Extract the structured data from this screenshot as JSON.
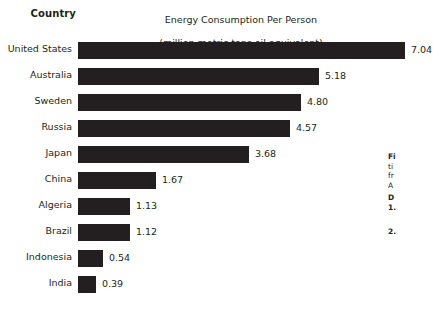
{
  "chart_data": {
    "type": "bar",
    "orientation": "horizontal",
    "title": "Energy Consumption Per Person\n(million metric tons oil equivalent)",
    "title_line1": "Energy Consumption Per Person",
    "title_line2": "(million metric tons oil equivalent)",
    "axis_header": "Country",
    "xlabel": "",
    "ylabel": "Country",
    "grid": false,
    "legend": false,
    "xlim": [
      0,
      7.04
    ],
    "categories": [
      "United States",
      "Australia",
      "Sweden",
      "Russia",
      "Japan",
      "China",
      "Algeria",
      "Brazil",
      "Indonesia",
      "India"
    ],
    "values": [
      7.04,
      5.18,
      4.8,
      4.57,
      3.68,
      1.67,
      1.13,
      1.12,
      0.54,
      0.39
    ],
    "value_labels": [
      "7.04",
      "5.18",
      "4.80",
      "4.57",
      "3.68",
      "1.67",
      "1.13",
      "1.12",
      "0.54",
      "0.39"
    ],
    "bar_color": "#231f20",
    "background_color": "#ffffff",
    "text_color": "#231f20",
    "rows": [
      {
        "label": "United States",
        "value": 7.04,
        "value_label": "7.04"
      },
      {
        "label": "Australia",
        "value": 5.18,
        "value_label": "5.18"
      },
      {
        "label": "Sweden",
        "value": 4.8,
        "value_label": "4.80"
      },
      {
        "label": "Russia",
        "value": 4.57,
        "value_label": "4.57"
      },
      {
        "label": "Japan",
        "value": 3.68,
        "value_label": "3.68"
      },
      {
        "label": "China",
        "value": 1.67,
        "value_label": "1.67"
      },
      {
        "label": "Algeria",
        "value": 1.13,
        "value_label": "1.13"
      },
      {
        "label": "Brazil",
        "value": 1.12,
        "value_label": "1.12"
      },
      {
        "label": "Indonesia",
        "value": 0.54,
        "value_label": "0.54"
      },
      {
        "label": "India",
        "value": 0.39,
        "value_label": "0.39"
      }
    ]
  },
  "side_note": {
    "line1": "Fi",
    "line2": "ti",
    "line3": "fr",
    "line4": "A",
    "line5": "D",
    "line6": "1.",
    "line7": "2."
  }
}
